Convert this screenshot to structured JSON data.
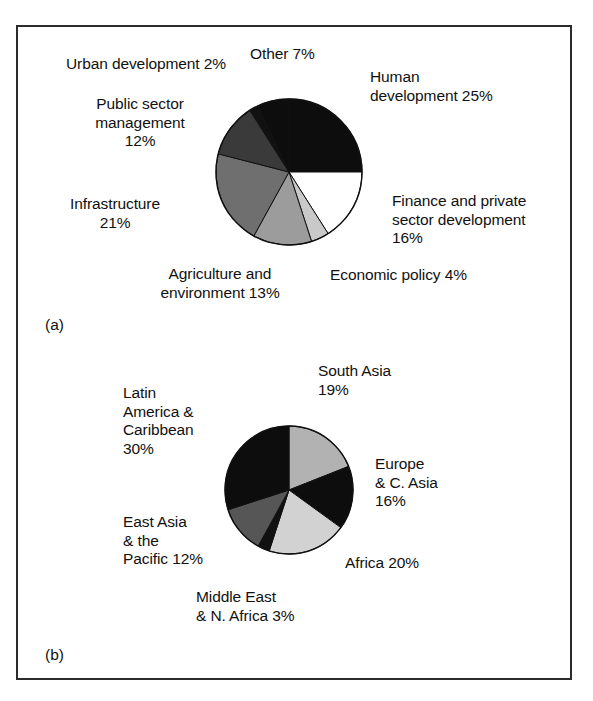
{
  "figure": {
    "panels": [
      {
        "tag": "(a)",
        "tag_name": "panel-tag-a",
        "labels": [
          {
            "name": "label-urban-development",
            "text": "Urban development 2%",
            "x": 66,
            "y": 55,
            "w": 210,
            "align": "l"
          },
          {
            "name": "label-other",
            "text": "Other 7%",
            "x": 250,
            "y": 45,
            "w": 110,
            "align": "l"
          },
          {
            "name": "label-human-development",
            "text": "Human\ndevelopment 25%",
            "x": 370,
            "y": 68,
            "w": 180,
            "align": "l"
          },
          {
            "name": "label-public-sector-management",
            "text": "Public sector\nmanagement\n12%",
            "x": 60,
            "y": 95,
            "w": 160,
            "align": "c"
          },
          {
            "name": "label-finance-private-sector",
            "text": "Finance and private\nsector development\n16%",
            "x": 392,
            "y": 192,
            "w": 190,
            "align": "l"
          },
          {
            "name": "label-infrastructure",
            "text": "Infrastructure\n21%",
            "x": 40,
            "y": 195,
            "w": 150,
            "align": "c"
          },
          {
            "name": "label-economic-policy",
            "text": "Economic policy 4%",
            "x": 330,
            "y": 266,
            "w": 180,
            "align": "l"
          },
          {
            "name": "label-agriculture-environment",
            "text": "Agriculture and\nenvironment 13%",
            "x": 130,
            "y": 265,
            "w": 180,
            "align": "c"
          }
        ]
      },
      {
        "tag": "(b)",
        "tag_name": "panel-tag-b",
        "labels": [
          {
            "name": "label-south-asia",
            "text": "South Asia\n19%",
            "x": 318,
            "y": 362,
            "w": 130,
            "align": "l"
          },
          {
            "name": "label-latin-america-caribbean",
            "text": "Latin\nAmerica &\nCaribbean\n30%",
            "x": 123,
            "y": 384,
            "w": 130,
            "align": "l"
          },
          {
            "name": "label-europe-central-asia",
            "text": "Europe\n& C. Asia\n16%",
            "x": 375,
            "y": 455,
            "w": 130,
            "align": "l"
          },
          {
            "name": "label-east-asia-pacific",
            "text": "East Asia\n& the\nPacific 12%",
            "x": 123,
            "y": 513,
            "w": 140,
            "align": "l"
          },
          {
            "name": "label-africa",
            "text": "Africa 20%",
            "x": 345,
            "y": 554,
            "w": 130,
            "align": "l"
          },
          {
            "name": "label-middle-east-north-africa",
            "text": "Middle East\n& N. Africa 3%",
            "x": 196,
            "y": 588,
            "w": 170,
            "align": "l"
          }
        ]
      }
    ]
  },
  "chart_data": [
    {
      "type": "pie",
      "id": "pie-a",
      "tag": "(a)",
      "title": "",
      "start_angle_deg": 0,
      "direction": "clockwise",
      "center": {
        "x": 289,
        "y": 172
      },
      "radius": 73,
      "categories": [
        "Human development",
        "Finance and private sector development",
        "Economic policy",
        "Agriculture and environment",
        "Infrastructure",
        "Public sector management",
        "Urban development",
        "Other"
      ],
      "values": [
        25,
        16,
        4,
        13,
        21,
        12,
        2,
        7
      ],
      "unit": "%",
      "colors": [
        "#0d0d0d",
        "#ffffff",
        "#c9c9c9",
        "#9c9c9c",
        "#6f6f6f",
        "#3a3a3a",
        "#111111",
        "#0d0d0d"
      ],
      "stroke": "#111111",
      "legend": "labels-around-slices"
    },
    {
      "type": "pie",
      "id": "pie-b",
      "tag": "(b)",
      "title": "",
      "start_angle_deg": 0,
      "direction": "clockwise",
      "center": {
        "x": 289,
        "y": 490
      },
      "radius": 64,
      "categories": [
        "South Asia",
        "Europe & C. Asia",
        "Africa",
        "Middle East & N. Africa",
        "East Asia & the Pacific",
        "Latin America & Caribbean"
      ],
      "values": [
        19,
        16,
        20,
        3,
        12,
        30
      ],
      "unit": "%",
      "colors": [
        "#b2b2b2",
        "#0d0d0d",
        "#d2d2d2",
        "#111111",
        "#565656",
        "#0d0d0d"
      ],
      "stroke": "#111111",
      "legend": "labels-around-slices"
    }
  ]
}
